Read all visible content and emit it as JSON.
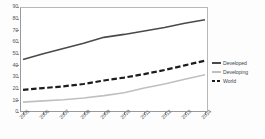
{
  "chart_data": {
    "type": "line",
    "title": "",
    "xlabel": "",
    "ylabel": "",
    "ylim": [
      0,
      90
    ],
    "ytick_values": [
      90,
      80,
      70,
      60,
      50,
      40,
      30,
      20,
      10,
      0
    ],
    "grid": false,
    "legend_position": "right",
    "categories": [
      "2005",
      "2006",
      "2007",
      "2008",
      "2009",
      "2010",
      "2011",
      "2012",
      "2013",
      "2014"
    ],
    "series": [
      {
        "name": "Developed",
        "style": "solid",
        "color": "#4a4a4a",
        "values": [
          45,
          50,
          54.5,
          59,
          64,
          66.5,
          69.5,
          72.5,
          76,
          79
        ]
      },
      {
        "name": "Developing",
        "style": "solid",
        "color": "#c0c0c0",
        "values": [
          8.5,
          9.5,
          10.5,
          12,
          14,
          16.5,
          20.5,
          24,
          28,
          32
        ]
      },
      {
        "name": "World",
        "style": "dashed",
        "color": "#1c1c1c",
        "values": [
          19,
          20.5,
          22,
          24,
          27,
          29.5,
          32.5,
          36,
          40,
          44
        ]
      }
    ]
  },
  "legend": {
    "items": [
      {
        "label": "Developed"
      },
      {
        "label": "Developing"
      },
      {
        "label": "World"
      }
    ]
  }
}
